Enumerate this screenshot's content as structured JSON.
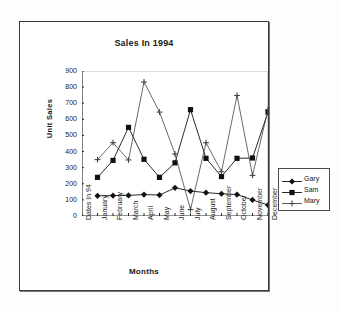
{
  "chart_frame": {
    "title": "Sales In 1994"
  },
  "axes": {
    "y_title": "Unit Sales",
    "x_title": "Months",
    "y_ticks": [
      "900",
      "800",
      "700",
      "600",
      "500",
      "400",
      "300",
      "200",
      "100",
      "0"
    ]
  },
  "legend": {
    "items": [
      {
        "label": "Gary",
        "marker": "diamond",
        "color": "#111111"
      },
      {
        "label": "Sam",
        "marker": "square",
        "color": "#111111"
      },
      {
        "label": "Mary",
        "marker": "plus",
        "color": "#444444"
      }
    ]
  },
  "chart_data": {
    "type": "line",
    "title": "Sales In 1994",
    "xlabel": "Months",
    "ylabel": "Unit Sales",
    "ylim": [
      0,
      900
    ],
    "ytick_step": 100,
    "grid": false,
    "legend_position": "right",
    "categories": [
      "Dates In 94",
      "January",
      "February",
      "March",
      "April",
      "May",
      "June",
      "July",
      "August",
      "September",
      "October",
      "November",
      "December"
    ],
    "series": [
      {
        "name": "Gary",
        "marker": "diamond",
        "values": [
          null,
          125,
          127,
          128,
          133,
          130,
          175,
          155,
          145,
          138,
          133,
          100,
          68
        ]
      },
      {
        "name": "Sam",
        "marker": "square",
        "values": [
          null,
          240,
          345,
          550,
          352,
          240,
          330,
          660,
          358,
          245,
          358,
          360,
          645
        ]
      },
      {
        "name": "Mary",
        "marker": "plus",
        "values": [
          null,
          350,
          455,
          348,
          832,
          645,
          385,
          40,
          455,
          275,
          748,
          252,
          660
        ]
      }
    ]
  }
}
